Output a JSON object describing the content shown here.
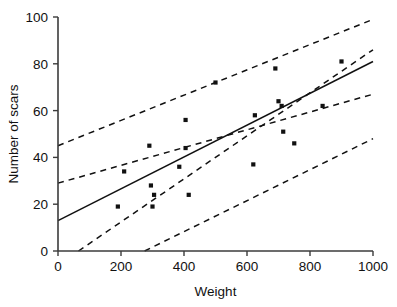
{
  "chart_data": {
    "type": "scatter",
    "title": "",
    "xlabel": "Weight",
    "ylabel": "Number of scars",
    "xlim": [
      0,
      1000
    ],
    "ylim": [
      0,
      100
    ],
    "xticks": [
      0,
      200,
      400,
      600,
      800,
      1000
    ],
    "yticks": [
      0,
      20,
      40,
      60,
      80,
      100
    ],
    "xtick_labels": [
      "0",
      "200",
      "400",
      "600",
      "800",
      "1000"
    ],
    "ytick_labels": [
      "0",
      "20",
      "40",
      "60",
      "80",
      "100"
    ],
    "grid": false,
    "legend": "none",
    "points": [
      {
        "x": 210,
        "y": 34
      },
      {
        "x": 190,
        "y": 19
      },
      {
        "x": 290,
        "y": 45
      },
      {
        "x": 295,
        "y": 28
      },
      {
        "x": 305,
        "y": 24
      },
      {
        "x": 300,
        "y": 19
      },
      {
        "x": 385,
        "y": 36
      },
      {
        "x": 405,
        "y": 56
      },
      {
        "x": 415,
        "y": 24
      },
      {
        "x": 500,
        "y": 72
      },
      {
        "x": 405,
        "y": 44
      },
      {
        "x": 625,
        "y": 58
      },
      {
        "x": 690,
        "y": 78
      },
      {
        "x": 700,
        "y": 64
      },
      {
        "x": 710,
        "y": 62
      },
      {
        "x": 620,
        "y": 37
      },
      {
        "x": 750,
        "y": 46
      },
      {
        "x": 840,
        "y": 62
      },
      {
        "x": 900,
        "y": 81
      },
      {
        "x": 715,
        "y": 51
      }
    ],
    "series": [
      {
        "name": "regression-line",
        "style": "solid",
        "endpoints": [
          {
            "x": 0,
            "y": 13
          },
          {
            "x": 1000,
            "y": 81
          }
        ]
      },
      {
        "name": "upper-confidence-band",
        "style": "dashed",
        "endpoints": [
          {
            "x": 0,
            "y": 45
          },
          {
            "x": 1000,
            "y": 99
          }
        ]
      },
      {
        "name": "lower-confidence-band",
        "style": "dashed",
        "endpoints": [
          {
            "x": 0,
            "y": 29
          },
          {
            "x": 1000,
            "y": 67
          }
        ]
      },
      {
        "name": "upper-prediction-band",
        "style": "dashed",
        "endpoints": [
          {
            "x": 65,
            "y": 0
          },
          {
            "x": 1000,
            "y": 86
          }
        ]
      },
      {
        "name": "lower-prediction-band",
        "style": "dashed",
        "endpoints": [
          {
            "x": 275,
            "y": 0
          },
          {
            "x": 1000,
            "y": 48
          }
        ]
      }
    ]
  },
  "axes": {
    "x_title": "Weight",
    "y_title": "Number of scars"
  }
}
